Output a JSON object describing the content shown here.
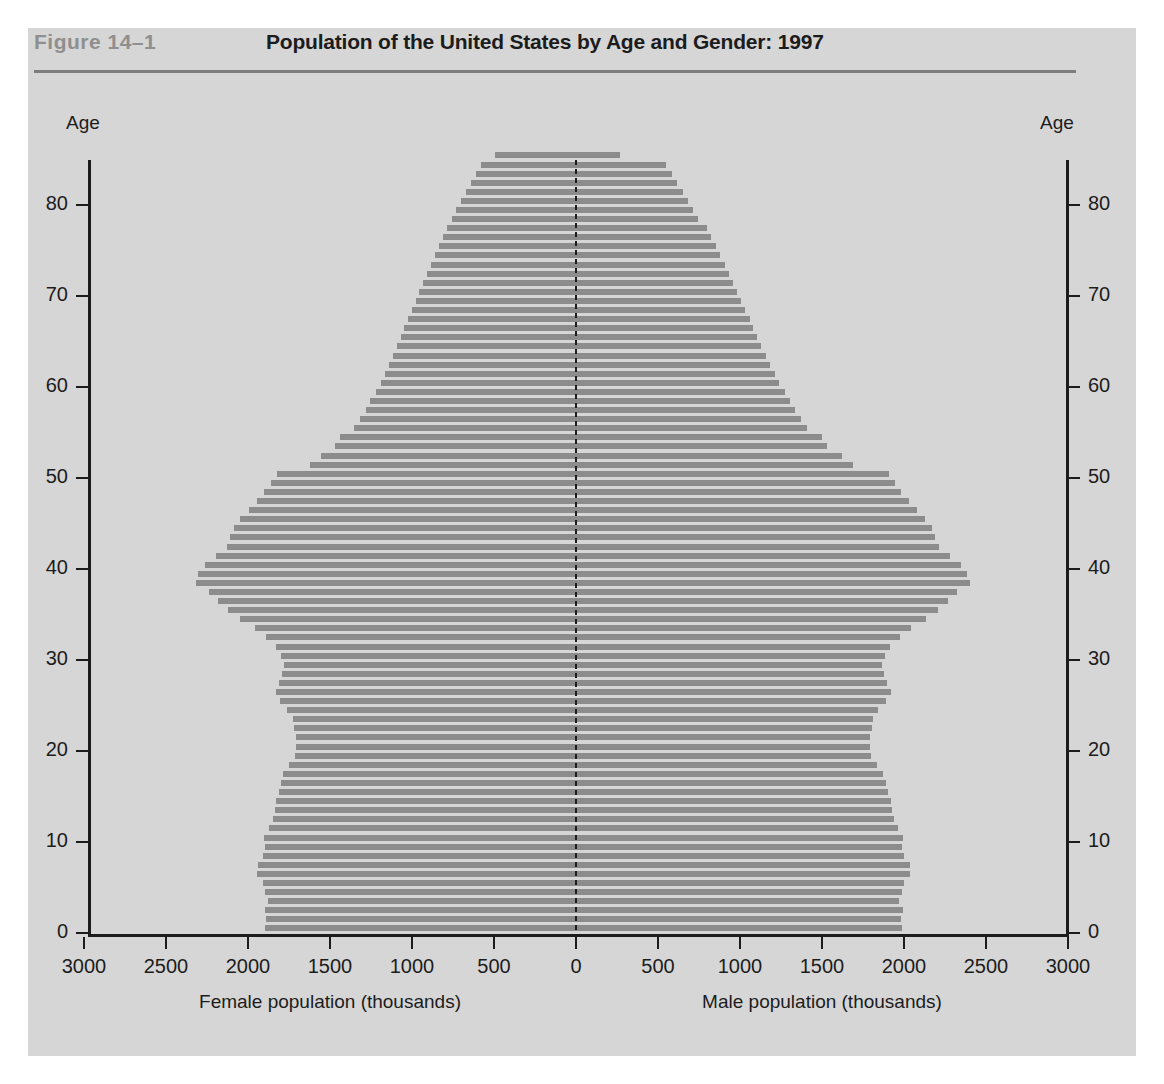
{
  "figure": {
    "label": "Figure  14–1",
    "title": "Population of the United States by Age and Gender: 1997"
  },
  "axes": {
    "y_axis_label_left": "Age",
    "y_axis_label_right": "Age",
    "y_ticks": [
      0,
      10,
      20,
      30,
      40,
      50,
      60,
      70,
      80
    ],
    "y_range": [
      0,
      85
    ],
    "x_ticks_left": [
      3000,
      2500,
      2000,
      1500,
      1000,
      500,
      0
    ],
    "x_ticks_right": [
      500,
      1000,
      1500,
      2000,
      2500,
      3000
    ],
    "x_range": [
      0,
      3000
    ],
    "x_title_left": "Female population (thousands)",
    "x_title_right": "Male population (thousands)"
  },
  "colors": {
    "panel_background": "#d6d6d6",
    "bar_fill": "#8c8c8c",
    "axis": "#1c1c1c",
    "figure_label": "#8f8f8f",
    "title": "#1c1c1c",
    "header_rule": "#7d7d7d"
  },
  "chart_data": {
    "type": "bar",
    "subtype": "population-pyramid",
    "title": "Population of the United States by Age and Gender: 1997",
    "xlabel": "Population (thousands)",
    "ylabel": "Age",
    "xlim": [
      0,
      3000
    ],
    "ylim": [
      0,
      85
    ],
    "grid": false,
    "legend": "none",
    "orientation": "horizontal-diverging",
    "unit": "thousands",
    "categories": [
      0,
      1,
      2,
      3,
      4,
      5,
      6,
      7,
      8,
      9,
      10,
      11,
      12,
      13,
      14,
      15,
      16,
      17,
      18,
      19,
      20,
      21,
      22,
      23,
      24,
      25,
      26,
      27,
      28,
      29,
      30,
      31,
      32,
      33,
      34,
      35,
      36,
      37,
      38,
      39,
      40,
      41,
      42,
      43,
      44,
      45,
      46,
      47,
      48,
      49,
      50,
      51,
      52,
      53,
      54,
      55,
      56,
      57,
      58,
      59,
      60,
      61,
      62,
      63,
      64,
      65,
      66,
      67,
      68,
      69,
      70,
      71,
      72,
      73,
      74,
      75,
      76,
      77,
      78,
      79,
      80,
      81,
      82,
      83,
      84,
      85
    ],
    "series": [
      {
        "name": "Female population (thousands)",
        "side": "left",
        "values": [
          1896,
          1890,
          1899,
          1881,
          1897,
          1908,
          1945,
          1941,
          1910,
          1896,
          1900,
          1872,
          1848,
          1838,
          1828,
          1810,
          1800,
          1784,
          1748,
          1712,
          1705,
          1710,
          1718,
          1724,
          1760,
          1806,
          1832,
          1812,
          1790,
          1778,
          1800,
          1830,
          1892,
          1958,
          2046,
          2124,
          2184,
          2240,
          2318,
          2302,
          2264,
          2196,
          2128,
          2108,
          2088,
          2046,
          1996,
          1948,
          1902,
          1862,
          1826,
          1620,
          1552,
          1468,
          1440,
          1352,
          1318,
          1282,
          1254,
          1222,
          1190,
          1166,
          1140,
          1116,
          1090,
          1068,
          1046,
          1024,
          1000,
          978,
          956,
          932,
          908,
          884,
          860,
          836,
          810,
          784,
          758,
          730,
          702,
          672,
          642,
          610,
          578,
          494
        ]
      },
      {
        "name": "Male population (thousands)",
        "side": "right",
        "values": [
          1988,
          1982,
          1991,
          1972,
          1988,
          2000,
          2038,
          2034,
          2002,
          1988,
          1992,
          1962,
          1938,
          1928,
          1918,
          1900,
          1888,
          1872,
          1834,
          1796,
          1790,
          1794,
          1802,
          1808,
          1844,
          1892,
          1918,
          1898,
          1876,
          1864,
          1886,
          1916,
          1978,
          2044,
          2132,
          2210,
          2270,
          2324,
          2402,
          2386,
          2348,
          2280,
          2212,
          2190,
          2170,
          2128,
          2078,
          2030,
          1984,
          1944,
          1908,
          1692,
          1620,
          1532,
          1502,
          1410,
          1374,
          1336,
          1306,
          1272,
          1238,
          1212,
          1184,
          1158,
          1130,
          1106,
          1082,
          1058,
          1032,
          1008,
          984,
          958,
          932,
          906,
          880,
          854,
          826,
          798,
          742,
          712,
          682,
          650,
          618,
          584,
          550,
          270
        ]
      }
    ]
  }
}
